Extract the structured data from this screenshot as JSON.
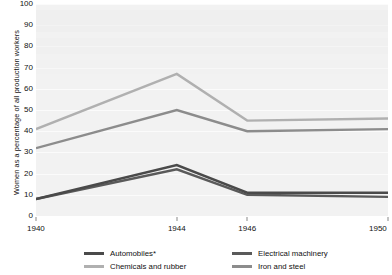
{
  "chart_data": {
    "type": "line",
    "title": "",
    "xlabel": "",
    "ylabel": "Women as a percentage of all production workers",
    "x": [
      1940,
      1944,
      1946,
      1950
    ],
    "xtick_labels": [
      "1940",
      "1944",
      "1946",
      "1950"
    ],
    "xlim": [
      1940,
      1950
    ],
    "ylim": [
      0,
      100
    ],
    "ytick_labels": [
      "0",
      "10",
      "20",
      "30",
      "40",
      "50",
      "60",
      "70",
      "80",
      "90",
      "100"
    ],
    "yticks": [
      0,
      10,
      20,
      30,
      40,
      50,
      60,
      70,
      80,
      90,
      100
    ],
    "grid": true,
    "legend_position": "bottom",
    "series": [
      {
        "name": "Automobiles*",
        "color": "#4a4a4a",
        "values": [
          8,
          24,
          11,
          11
        ]
      },
      {
        "name": "Chemicals and rubber",
        "color": "#b0b0b0",
        "values": [
          41,
          67,
          45,
          46
        ]
      },
      {
        "name": "Electrical machinery",
        "color": "#5a5a5a",
        "values": [
          8,
          22,
          10,
          9
        ]
      },
      {
        "name": "Iron and steel",
        "color": "#8c8c8c",
        "values": [
          32,
          50,
          40,
          41
        ]
      }
    ]
  },
  "legend": {
    "items": [
      {
        "label": "Automobiles*",
        "color": "#4a4a4a"
      },
      {
        "label": "Chemicals and rubber",
        "color": "#b0b0b0"
      },
      {
        "label": "Electrical machinery",
        "color": "#5a5a5a"
      },
      {
        "label": "Iron and steel",
        "color": "#8c8c8c"
      }
    ]
  },
  "axis": {
    "y_title": "Women as a percentage of all production workers"
  }
}
